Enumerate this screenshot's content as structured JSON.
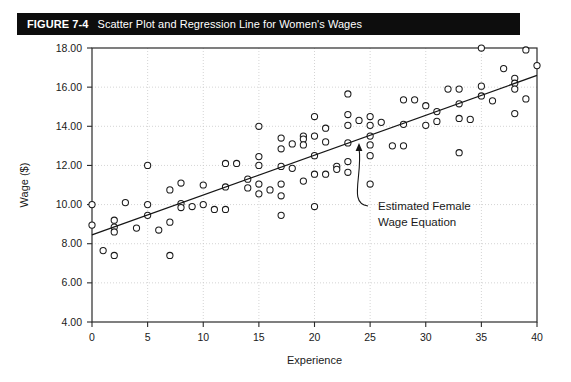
{
  "figure": {
    "label": "FIGURE 7-4",
    "title": "Scatter Plot and Regression Line for Women's Wages"
  },
  "chart_data": {
    "type": "scatter",
    "title": "Scatter Plot and Regression Line for Women's Wages",
    "xlabel": "Experience",
    "ylabel": "Wage ($)",
    "xlim": [
      0,
      40
    ],
    "ylim": [
      4.0,
      18.0
    ],
    "xticks": [
      "0",
      "5",
      "10",
      "15",
      "20",
      "25",
      "30",
      "35",
      "40"
    ],
    "xtick_values": [
      0,
      5,
      10,
      15,
      20,
      25,
      30,
      35,
      40
    ],
    "yticks": [
      "4.00",
      "6.00",
      "8.00",
      "10.00",
      "12.00",
      "14.00",
      "16.00",
      "18.00"
    ],
    "ytick_values": [
      4,
      6,
      8,
      10,
      12,
      14,
      16,
      18
    ],
    "grid": true,
    "legend": "none",
    "marker": "open-circle",
    "points": [
      [
        0,
        10.0
      ],
      [
        0,
        8.95
      ],
      [
        1,
        7.65
      ],
      [
        2,
        9.2
      ],
      [
        2,
        8.85
      ],
      [
        2,
        8.6
      ],
      [
        2,
        7.4
      ],
      [
        3,
        10.1
      ],
      [
        4,
        8.8
      ],
      [
        5,
        12.0
      ],
      [
        5,
        10.0
      ],
      [
        5,
        9.45
      ],
      [
        6,
        8.7
      ],
      [
        7,
        10.75
      ],
      [
        7,
        9.1
      ],
      [
        7,
        7.4
      ],
      [
        8,
        11.1
      ],
      [
        8,
        10.05
      ],
      [
        8,
        9.85
      ],
      [
        9,
        9.9
      ],
      [
        10,
        11.0
      ],
      [
        10,
        10.0
      ],
      [
        11,
        9.75
      ],
      [
        12,
        12.1
      ],
      [
        12,
        10.9
      ],
      [
        12,
        9.75
      ],
      [
        13,
        12.1
      ],
      [
        14,
        11.3
      ],
      [
        14,
        10.85
      ],
      [
        15,
        14.0
      ],
      [
        15,
        12.45
      ],
      [
        15,
        12.0
      ],
      [
        15,
        11.05
      ],
      [
        15,
        10.55
      ],
      [
        16,
        10.75
      ],
      [
        17,
        13.4
      ],
      [
        17,
        12.85
      ],
      [
        17,
        11.95
      ],
      [
        17,
        11.05
      ],
      [
        17,
        10.45
      ],
      [
        17,
        9.45
      ],
      [
        18,
        13.1
      ],
      [
        18,
        11.85
      ],
      [
        19,
        13.5
      ],
      [
        19,
        13.35
      ],
      [
        19,
        13.05
      ],
      [
        19,
        11.2
      ],
      [
        20,
        14.5
      ],
      [
        20,
        13.5
      ],
      [
        20,
        12.5
      ],
      [
        20,
        11.55
      ],
      [
        20,
        9.9
      ],
      [
        21,
        13.9
      ],
      [
        21,
        13.2
      ],
      [
        21,
        11.55
      ],
      [
        22,
        11.95
      ],
      [
        22,
        11.8
      ],
      [
        23,
        15.65
      ],
      [
        23,
        14.6
      ],
      [
        23,
        14.05
      ],
      [
        23,
        13.15
      ],
      [
        23,
        12.2
      ],
      [
        23,
        11.65
      ],
      [
        24,
        14.3
      ],
      [
        25,
        14.5
      ],
      [
        25,
        14.05
      ],
      [
        25,
        13.5
      ],
      [
        25,
        13.05
      ],
      [
        25,
        12.5
      ],
      [
        25,
        11.05
      ],
      [
        26,
        14.2
      ],
      [
        27,
        13.0
      ],
      [
        28,
        15.35
      ],
      [
        28,
        14.1
      ],
      [
        28,
        13.0
      ],
      [
        29,
        15.35
      ],
      [
        30,
        15.05
      ],
      [
        30,
        14.05
      ],
      [
        31,
        14.75
      ],
      [
        31,
        14.25
      ],
      [
        32,
        15.9
      ],
      [
        33,
        15.9
      ],
      [
        33,
        15.15
      ],
      [
        33,
        14.4
      ],
      [
        33,
        12.65
      ],
      [
        34,
        14.35
      ],
      [
        35,
        18.0
      ],
      [
        35,
        16.05
      ],
      [
        35,
        15.55
      ],
      [
        36,
        15.3
      ],
      [
        37,
        16.95
      ],
      [
        38,
        16.45
      ],
      [
        38,
        16.2
      ],
      [
        38,
        15.9
      ],
      [
        38,
        14.65
      ],
      [
        39,
        17.9
      ],
      [
        39,
        15.4
      ],
      [
        40,
        17.1
      ]
    ],
    "regression_line": {
      "x_start": 0,
      "y_start": 8.45,
      "x_end": 40,
      "y_end": 16.6,
      "label": "Estimated Female Wage Equation"
    },
    "annotation": {
      "line1": "Estimated Female",
      "line2": "Wage Equation",
      "target_x": 24,
      "target_y": 13.25
    }
  }
}
